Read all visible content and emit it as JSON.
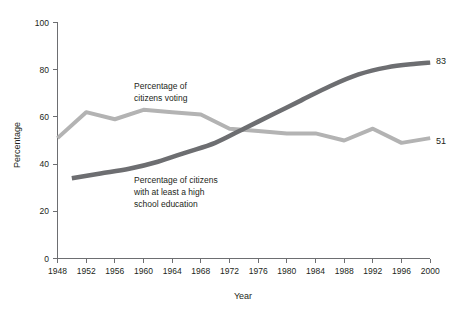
{
  "chart_data": {
    "type": "line",
    "title": "",
    "xlabel": "Year",
    "ylabel": "Percentage",
    "xlim": [
      1948,
      2000
    ],
    "ylim": [
      0,
      100
    ],
    "grid": false,
    "legend_position": "inline-annotations",
    "x_ticks": [
      1948,
      1952,
      1956,
      1960,
      1964,
      1968,
      1972,
      1976,
      1980,
      1984,
      1988,
      1992,
      1996,
      2000
    ],
    "y_ticks": [
      0,
      20,
      40,
      60,
      80,
      100
    ],
    "series": [
      {
        "name": "Percentage of citizens voting",
        "color": "#b3b3b3",
        "annotation": "Percentage of\ncitizens voting",
        "annotation_line1": "Percentage of",
        "annotation_line2": "citizens voting",
        "end_label": "51",
        "x": [
          1948,
          1952,
          1956,
          1960,
          1964,
          1968,
          1972,
          1976,
          1980,
          1984,
          1988,
          1992,
          1996,
          2000
        ],
        "values": [
          51,
          62,
          59,
          63,
          62,
          61,
          55,
          54,
          53,
          53,
          50,
          55,
          49,
          51
        ]
      },
      {
        "name": "Percentage of citizens with at least a high school education",
        "color": "#6d6e71",
        "annotation": "Percentage of citizens\nwith at least a high\nschool education",
        "annotation_line1": "Percentage of citizens",
        "annotation_line2": "with at least a high",
        "annotation_line3": "school education",
        "end_label": "83",
        "x": [
          1950,
          1954,
          1958,
          1962,
          1966,
          1970,
          1974,
          1978,
          1982,
          1986,
          1990,
          1994,
          1998,
          2000
        ],
        "values": [
          34,
          36,
          38,
          41,
          45,
          49,
          55,
          61,
          67,
          73,
          78,
          81,
          82.5,
          83
        ]
      }
    ]
  },
  "axis": {
    "y_tick_labels": [
      "100",
      "80",
      "60",
      "40",
      "20",
      "0"
    ],
    "x_tick_labels": [
      "1948",
      "1952",
      "1956",
      "1960",
      "1964",
      "1968",
      "1972",
      "1976",
      "1980",
      "1984",
      "1988",
      "1992",
      "1996",
      "2000"
    ],
    "x_title": "Year",
    "y_title": "Percentage"
  },
  "annotations": {
    "voting_line1": "Percentage of",
    "voting_line2": "citizens voting",
    "education_line1": "Percentage of citizens",
    "education_line2": "with at least a high",
    "education_line3": "school education",
    "end_label_education": "83",
    "end_label_voting": "51"
  },
  "colors": {
    "voting_series": "#b3b3b3",
    "education_series": "#6d6e71",
    "axis": "#6d6e71",
    "text": "#231f20",
    "background": "#ffffff"
  }
}
